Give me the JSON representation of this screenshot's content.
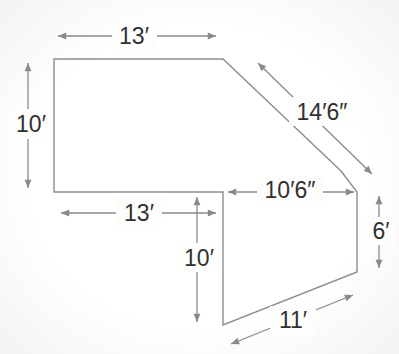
{
  "diagram": {
    "background_color": "#fdfdfc",
    "line_color": "#8a8a8a",
    "text_color": "#303030",
    "measurements": [
      {
        "side": "top-width",
        "label": "13′"
      },
      {
        "side": "left-height",
        "label": "10′"
      },
      {
        "side": "upper-diagonal",
        "label": "14′6″"
      },
      {
        "side": "inner-width",
        "label": "10′6″"
      },
      {
        "side": "right-height",
        "label": "6′"
      },
      {
        "side": "lower-left-width",
        "label": "13′"
      },
      {
        "side": "inner-height",
        "label": "10′"
      },
      {
        "side": "lower-diagonal",
        "label": "11′"
      }
    ]
  }
}
